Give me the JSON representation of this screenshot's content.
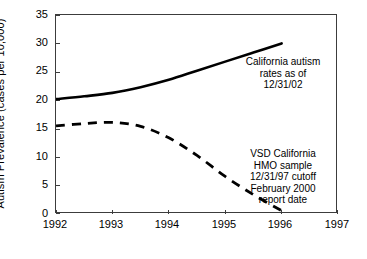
{
  "chart_data": {
    "type": "line",
    "title": "",
    "xlabel": "Year of Birth",
    "ylabel": "Autism Prevalence (cases per 10,000)",
    "xlim": [
      1992,
      1997
    ],
    "ylim": [
      0,
      35
    ],
    "xticks": [
      "1992",
      "1993",
      "1994",
      "1995",
      "1996",
      "1997"
    ],
    "yticks": [
      "0",
      "5",
      "10",
      "15",
      "20",
      "25",
      "30",
      "35"
    ],
    "grid": false,
    "legend_position": "none",
    "series": [
      {
        "name": "California autism rates as of 12/31/02",
        "style": "solid",
        "color": "#000000",
        "x": [
          1992,
          1992.5,
          1993,
          1993.5,
          1994,
          1994.5,
          1995,
          1995.5,
          1996
        ],
        "values": [
          20.2,
          20.7,
          21.3,
          22.3,
          23.6,
          25.2,
          26.8,
          28.4,
          30.0
        ]
      },
      {
        "name": "VSD California HMO sample 12/31/97 cutoff February 2000 report date",
        "style": "dashed",
        "color": "#000000",
        "x": [
          1992,
          1992.5,
          1993,
          1993.5,
          1994,
          1994.5,
          1995,
          1995.5,
          1996
        ],
        "values": [
          15.5,
          15.9,
          16.1,
          15.4,
          13.4,
          10.3,
          6.6,
          3.4,
          0.6
        ]
      }
    ],
    "annotations": [
      {
        "name": "california-autism-rates",
        "lines": [
          "California autism",
          "rates as of",
          "12/31/02"
        ]
      },
      {
        "name": "vsd-california-hmo",
        "lines": [
          "VSD California",
          "HMO sample",
          "12/31/97 cutoff",
          "February 2000",
          "report date"
        ]
      }
    ]
  },
  "axes": {
    "ylabel": "Autism Prevalence (cases per 10,000)",
    "xlabel": "Year of Birth"
  }
}
